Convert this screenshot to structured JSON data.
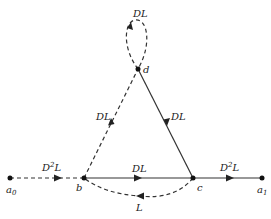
{
  "diagram": {
    "type": "signal-flow-graph",
    "nodes": [
      {
        "id": "a0",
        "label": "a",
        "sub": "0",
        "x": 10,
        "y": 178
      },
      {
        "id": "b",
        "label": "b",
        "x": 84,
        "y": 178
      },
      {
        "id": "c",
        "label": "c",
        "x": 193,
        "y": 178
      },
      {
        "id": "a1",
        "label": "a",
        "sub": "1",
        "x": 262,
        "y": 178
      },
      {
        "id": "d",
        "label": "d",
        "x": 138,
        "y": 69
      }
    ],
    "edges": [
      {
        "from": "a0",
        "to": "b",
        "label": "D",
        "sup": "2",
        "tail": "L",
        "style": "dashed"
      },
      {
        "from": "b",
        "to": "c",
        "label": "DL",
        "style": "solid"
      },
      {
        "from": "c",
        "to": "a1",
        "label": "D",
        "sup": "2",
        "tail": "L",
        "style": "solid"
      },
      {
        "from": "b",
        "to": "d",
        "label": "DL",
        "style": "dashed"
      },
      {
        "from": "d",
        "to": "c",
        "label": "DL",
        "style": "solid"
      },
      {
        "from": "c",
        "to": "b",
        "label": "L",
        "style": "dashed"
      },
      {
        "from": "d",
        "to": "d",
        "label": "DL",
        "style": "dashed",
        "kind": "self-loop"
      }
    ]
  }
}
